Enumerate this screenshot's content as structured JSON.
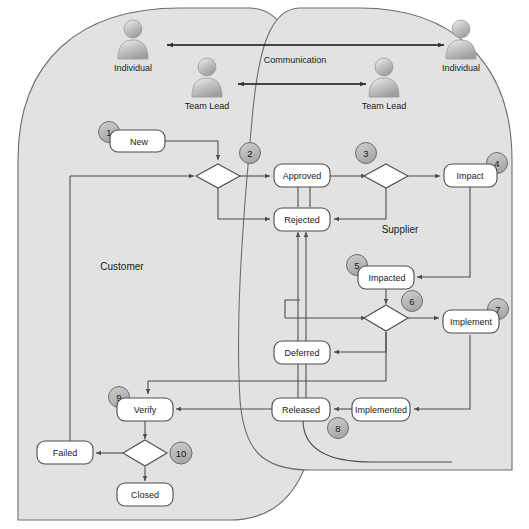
{
  "diagram": {
    "pools": [
      {
        "id": "customer",
        "label": "Customer"
      },
      {
        "id": "supplier",
        "label": "Supplier"
      }
    ],
    "actors": [
      {
        "id": "cust-individual",
        "label": "Individual",
        "pool": "customer"
      },
      {
        "id": "cust-team-lead",
        "label": "Team Lead",
        "pool": "customer"
      },
      {
        "id": "supp-team-lead",
        "label": "Team Lead",
        "pool": "supplier"
      },
      {
        "id": "supp-individual",
        "label": "Individual",
        "pool": "supplier"
      }
    ],
    "communication_label": "Communication",
    "nodes": [
      {
        "id": "new",
        "label": "New",
        "badge": "1",
        "pool": "customer"
      },
      {
        "id": "approved",
        "label": "Approved",
        "badge": null,
        "pool": "boundary"
      },
      {
        "id": "rejected",
        "label": "Rejected",
        "badge": null,
        "pool": "boundary"
      },
      {
        "id": "impact",
        "label": "Impact",
        "badge": "4",
        "pool": "supplier"
      },
      {
        "id": "impacted",
        "label": "Impacted",
        "badge": "5",
        "pool": "supplier"
      },
      {
        "id": "implement",
        "label": "Implement",
        "badge": "7",
        "pool": "supplier"
      },
      {
        "id": "deferred",
        "label": "Deferred",
        "badge": null,
        "pool": "boundary"
      },
      {
        "id": "released",
        "label": "Released",
        "badge": "8",
        "pool": "boundary"
      },
      {
        "id": "implemented",
        "label": "Implemented",
        "badge": null,
        "pool": "supplier"
      },
      {
        "id": "verify",
        "label": "Verify",
        "badge": "9",
        "pool": "customer"
      },
      {
        "id": "failed",
        "label": "Failed",
        "badge": null,
        "pool": "customer"
      },
      {
        "id": "closed",
        "label": "Closed",
        "badge": null,
        "pool": "customer"
      }
    ],
    "decisions": [
      {
        "id": "d2",
        "badge": "2",
        "pool": "customer"
      },
      {
        "id": "d3",
        "badge": "3",
        "pool": "supplier"
      },
      {
        "id": "d6",
        "badge": "6",
        "pool": "supplier"
      },
      {
        "id": "d10",
        "badge": "10",
        "pool": "customer"
      }
    ],
    "badges": [
      "1",
      "2",
      "3",
      "4",
      "5",
      "6",
      "7",
      "8",
      "9",
      "10"
    ],
    "colors": {
      "pool_fill": "#e2e2e2",
      "pool_stroke": "#6e6e6e",
      "node_fill": "#ffffff",
      "node_stroke": "#4d4d4d",
      "badge_fill": "#b9b9b9",
      "badge_stroke": "#6e6e6e",
      "connector": "#4d4d4d",
      "text": "#1a1a1a",
      "page_background": "#ffffff"
    }
  }
}
